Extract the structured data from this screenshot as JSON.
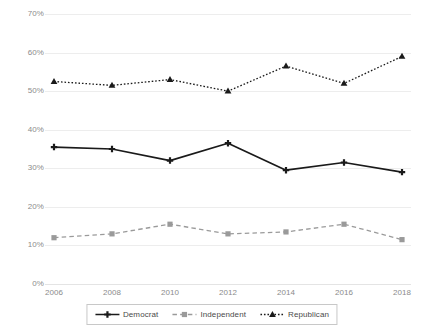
{
  "chart_data": {
    "type": "line",
    "title": "",
    "subtitle": "",
    "xlabel": "",
    "ylabel": "",
    "categories": [
      "2006",
      "2008",
      "2010",
      "2012",
      "2014",
      "2016",
      "2018"
    ],
    "x": [
      2006,
      2008,
      2010,
      2012,
      2014,
      2016,
      2018
    ],
    "ylim": [
      0,
      70
    ],
    "ytick_values": [
      70,
      60,
      50,
      40,
      30,
      20,
      10,
      0
    ],
    "ytick_labels": [
      "70%",
      "60%",
      "50%",
      "40%",
      "30%",
      "20%",
      "10%",
      "0%"
    ],
    "grid": true,
    "legend_position": "bottom-center",
    "series": [
      {
        "name": "Democrat",
        "values": [
          35.5,
          35.0,
          32.0,
          36.5,
          29.5,
          31.5,
          29.0
        ],
        "color": "#1a1a1a",
        "line_style": "solid",
        "marker": "plus"
      },
      {
        "name": "Independent",
        "values": [
          12.0,
          13.0,
          15.5,
          13.0,
          13.5,
          15.5,
          11.5
        ],
        "color": "#9a9a9a",
        "line_style": "dashed",
        "marker": "square"
      },
      {
        "name": "Republican",
        "values": [
          52.5,
          51.5,
          53.0,
          50.0,
          56.5,
          52.0,
          59.0
        ],
        "color": "#1a1a1a",
        "line_style": "dotted",
        "marker": "triangle"
      }
    ]
  },
  "legend": {
    "items": [
      {
        "label": "Democrat"
      },
      {
        "label": "Independent"
      },
      {
        "label": "Republican"
      }
    ]
  },
  "colors": {
    "background": "#ffffff",
    "gridline": "#ededed",
    "axis_text": "#8b8b8b",
    "legend_border": "#c8c8c8",
    "legend_text": "#4a4a4a"
  }
}
